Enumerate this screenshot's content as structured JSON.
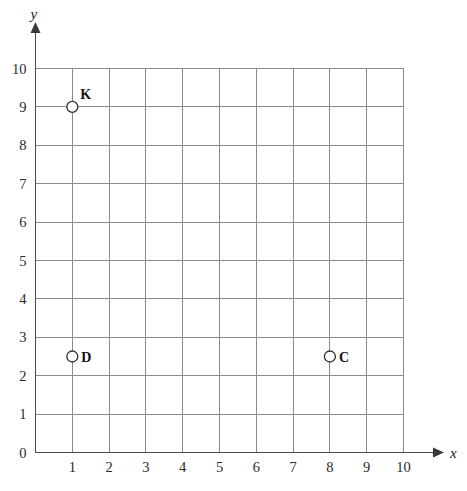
{
  "chart_data": {
    "type": "scatter",
    "title": "",
    "subtitle": "",
    "xlabel": "x",
    "ylabel": "y",
    "xlim": [
      0,
      10
    ],
    "ylim": [
      0,
      10
    ],
    "x_ticks": [
      0,
      1,
      2,
      3,
      4,
      5,
      6,
      7,
      8,
      9,
      10
    ],
    "y_ticks": [
      0,
      1,
      2,
      3,
      4,
      5,
      6,
      7,
      8,
      9,
      10
    ],
    "x_tick_labels": [
      "0",
      "1",
      "2",
      "3",
      "4",
      "5",
      "6",
      "7",
      "8",
      "9",
      "10"
    ],
    "y_tick_labels": [
      "0",
      "1",
      "2",
      "3",
      "4",
      "5",
      "6",
      "7",
      "8",
      "9",
      "10"
    ],
    "grid": true,
    "legend": "none",
    "marker_style": "open-circle",
    "points": [
      {
        "label": "K",
        "x": 1,
        "y": 9,
        "label_position": "above-right"
      },
      {
        "label": "D",
        "x": 1,
        "y": 2.5,
        "label_position": "right"
      },
      {
        "label": "C",
        "x": 8,
        "y": 2.5,
        "label_position": "right"
      }
    ],
    "colors": {
      "background": "#ffffff",
      "grid": "#8a8a8a",
      "axis": "#4a4a4a",
      "marker_fill": "#ffffff",
      "marker_stroke": "#2f2f2f",
      "text": "#1a1a1a"
    }
  },
  "axes": {
    "x_name": "x",
    "y_name": "y"
  }
}
